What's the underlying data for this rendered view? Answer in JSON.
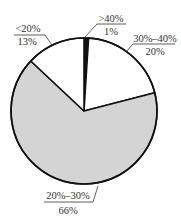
{
  "chart_data": {
    "type": "pie",
    "title": "",
    "start_angle": "top (12 o'clock), clockwise",
    "slices": [
      {
        "label": ">40%",
        "value": 1,
        "display": "1%",
        "color": "#111111"
      },
      {
        "label": "30%–40%",
        "value": 20,
        "display": "20%",
        "color": "#ffffff"
      },
      {
        "label": "20%–30%",
        "value": 66,
        "display": "66%",
        "color": "#d4d4d4"
      },
      {
        "label": "<20%",
        "value": 13,
        "display": "13%",
        "color": "#ffffff"
      }
    ],
    "categories": [
      ">40%",
      "30%–40%",
      "20%–30%",
      "<20%"
    ],
    "values": [
      1,
      20,
      66,
      13
    ],
    "legend": "none (leader-line labels)"
  },
  "labels": {
    "gt40": {
      "name": ">40%",
      "pct": "1%"
    },
    "r3040": {
      "name": "30%–40%",
      "pct": "20%"
    },
    "r2030": {
      "name": "20%–30%",
      "pct": "66%"
    },
    "lt20": {
      "name": "<20%",
      "pct": "13%"
    }
  },
  "style": {
    "outline": "#111111",
    "gray": "#d4d4d4"
  }
}
